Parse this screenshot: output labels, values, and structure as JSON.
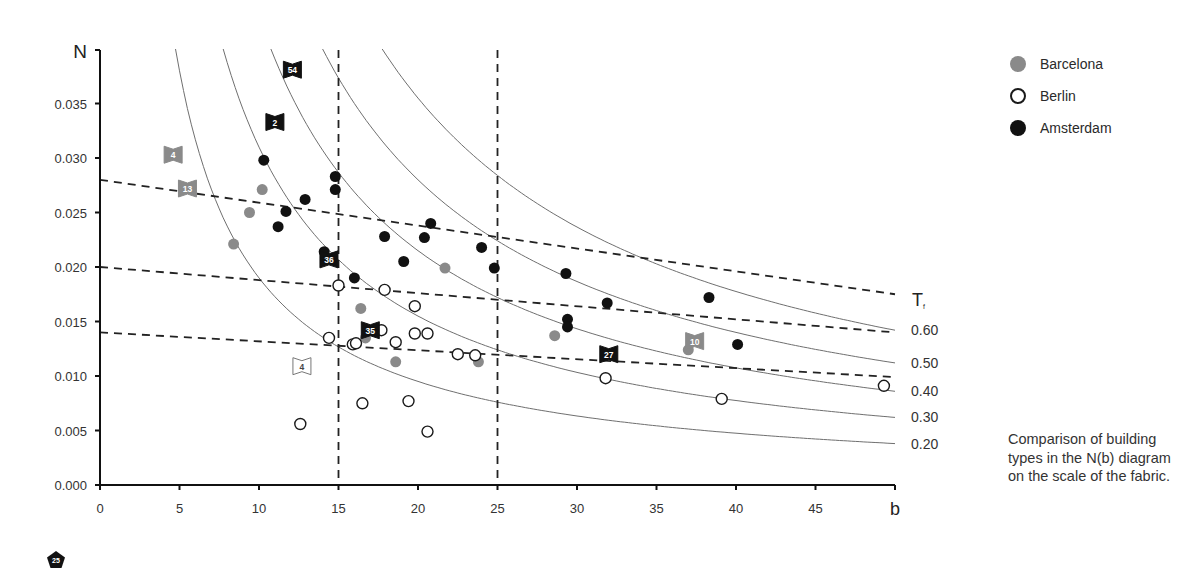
{
  "legend": {
    "items": [
      {
        "label": "Barcelona",
        "style": "filled-gray",
        "color": "#8a8a8a"
      },
      {
        "label": "Berlin",
        "style": "open",
        "color": "#1a1a1a"
      },
      {
        "label": "Amsterdam",
        "style": "filled-black",
        "color": "#111111"
      }
    ]
  },
  "caption": "Comparison of building types in the N(b) diagram on the scale of the fabric.",
  "page_badge": "25",
  "chart_data": {
    "type": "scatter",
    "title": "",
    "xlabel": "b",
    "ylabel": "N",
    "xlim": [
      0,
      50
    ],
    "ylim": [
      0,
      0.04
    ],
    "x_ticks": [
      0,
      5,
      10,
      15,
      20,
      25,
      30,
      35,
      40,
      45
    ],
    "x_tick_labels": [
      "0",
      "5",
      "10",
      "15",
      "20",
      "25",
      "30",
      "35",
      "40",
      "45"
    ],
    "y_ticks": [
      0.0,
      0.005,
      0.01,
      0.015,
      0.02,
      0.025,
      0.03,
      0.035
    ],
    "y_tick_labels": [
      "0.000",
      "0.005",
      "0.010",
      "0.015",
      "0.020",
      "0.025",
      "0.030",
      "0.035"
    ],
    "grid": false,
    "legend_position": "right",
    "series": [
      {
        "name": "Barcelona",
        "marker": "filled-gray",
        "color": "#8a8a8a",
        "points": [
          [
            8.4,
            0.0221
          ],
          [
            9.4,
            0.025
          ],
          [
            10.2,
            0.0271
          ],
          [
            21.7,
            0.0199
          ],
          [
            16.4,
            0.0162
          ],
          [
            16.7,
            0.0135
          ],
          [
            18.6,
            0.0113
          ],
          [
            23.8,
            0.0113
          ],
          [
            28.6,
            0.0137
          ],
          [
            37.0,
            0.0124
          ]
        ]
      },
      {
        "name": "Berlin",
        "marker": "open",
        "color": "#1a1a1a",
        "points": [
          [
            15.0,
            0.0183
          ],
          [
            17.9,
            0.0179
          ],
          [
            19.8,
            0.0164
          ],
          [
            14.4,
            0.0135
          ],
          [
            15.9,
            0.0129
          ],
          [
            16.1,
            0.013
          ],
          [
            17.7,
            0.0142
          ],
          [
            18.6,
            0.0131
          ],
          [
            19.8,
            0.0139
          ],
          [
            20.6,
            0.0139
          ],
          [
            22.5,
            0.012
          ],
          [
            23.6,
            0.0119
          ],
          [
            31.8,
            0.0098
          ],
          [
            39.1,
            0.0079
          ],
          [
            49.3,
            0.0091
          ],
          [
            12.6,
            0.0056
          ],
          [
            16.5,
            0.0075
          ],
          [
            19.4,
            0.0077
          ],
          [
            20.6,
            0.0049
          ]
        ]
      },
      {
        "name": "Amsterdam",
        "marker": "filled-black",
        "color": "#111111",
        "points": [
          [
            10.3,
            0.0298
          ],
          [
            11.7,
            0.0251
          ],
          [
            11.2,
            0.0237
          ],
          [
            12.9,
            0.0262
          ],
          [
            14.8,
            0.0283
          ],
          [
            14.8,
            0.0271
          ],
          [
            14.1,
            0.0214
          ],
          [
            16.0,
            0.019
          ],
          [
            17.9,
            0.0228
          ],
          [
            19.1,
            0.0205
          ],
          [
            20.4,
            0.0227
          ],
          [
            20.8,
            0.024
          ],
          [
            24.0,
            0.0218
          ],
          [
            24.8,
            0.0199
          ],
          [
            29.3,
            0.0194
          ],
          [
            31.9,
            0.0167
          ],
          [
            29.4,
            0.0152
          ],
          [
            29.4,
            0.0145
          ],
          [
            38.3,
            0.0172
          ],
          [
            40.1,
            0.0129
          ]
        ]
      }
    ],
    "flags": [
      {
        "label": "54",
        "b": 12.1,
        "N": 0.0381,
        "color": "#111111"
      },
      {
        "label": "2",
        "b": 11.0,
        "N": 0.0333,
        "color": "#111111"
      },
      {
        "label": "4",
        "b": 4.6,
        "N": 0.0303,
        "color": "#8a8a8a"
      },
      {
        "label": "13",
        "b": 5.5,
        "N": 0.0272,
        "color": "#8a8a8a"
      },
      {
        "label": "36",
        "b": 14.4,
        "N": 0.0207,
        "color": "#111111"
      },
      {
        "label": "35",
        "b": 17.0,
        "N": 0.0142,
        "color": "#111111"
      },
      {
        "label": "4",
        "b": 12.7,
        "N": 0.0109,
        "color": "#ffffff",
        "outline": true
      },
      {
        "label": "27",
        "b": 32.0,
        "N": 0.012,
        "color": "#111111"
      },
      {
        "label": "10",
        "b": 37.4,
        "N": 0.0132,
        "color": "#8a8a8a"
      }
    ],
    "iso_curves": {
      "label_header": "T",
      "label_subscript": "f",
      "curves": [
        {
          "label": "0.60",
          "k": 0.71
        },
        {
          "label": "0.50",
          "k": 0.56
        },
        {
          "label": "0.40",
          "k": 0.43
        },
        {
          "label": "0.30",
          "k": 0.31
        },
        {
          "label": "0.20",
          "k": 0.19
        }
      ]
    },
    "dashed_lines": {
      "sloped": [
        {
          "from": [
            0,
            0.028
          ],
          "to": [
            50,
            0.0175
          ]
        },
        {
          "from": [
            0,
            0.02
          ],
          "to": [
            50,
            0.014
          ]
        },
        {
          "from": [
            0,
            0.014
          ],
          "to": [
            50,
            0.0099
          ]
        }
      ],
      "vertical": [
        15,
        25
      ]
    }
  }
}
